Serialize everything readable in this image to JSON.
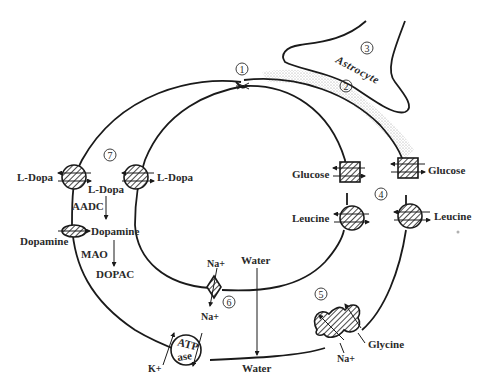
{
  "diagram": {
    "type": "blood-brain-barrier-transport",
    "circled_numbers": [
      "1",
      "2",
      "3",
      "4",
      "5",
      "6",
      "7"
    ],
    "labels": {
      "astrocyte": "Astrocyte",
      "ldopa_outer": "L-Dopa",
      "ldopa_inner": "L-Dopa",
      "ldopa_cyto": "L-Dopa",
      "aadc": "AADC",
      "dopamine_outer": "Dopamine",
      "dopamine_cyto": "Dopamine",
      "mao": "MAO",
      "dopac": "DOPAC",
      "glucose_inner": "Glucose",
      "glucose_outer": "Glucose",
      "leucine_inner": "Leucine",
      "leucine_outer": "Leucine",
      "na_top": "Na+",
      "na_bottom": "Na+",
      "water_top": "Water",
      "water_bottom": "Water",
      "atp": "ATP",
      "ase": "ase",
      "k": "K+",
      "glycine": "Glycine",
      "na_glycine": "Na+"
    },
    "colors": {
      "line": "#1a1a1a",
      "text": "#2a2a2a",
      "stipple": "#b8b8b8",
      "background": "#ffffff"
    }
  }
}
